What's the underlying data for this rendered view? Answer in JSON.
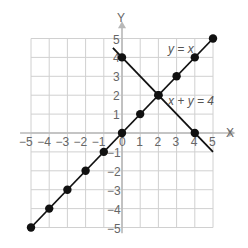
{
  "chart_data": {
    "type": "line",
    "title": "",
    "xlabel": "X",
    "ylabel": "Y",
    "xlim": [
      -5,
      5
    ],
    "ylim": [
      -5,
      5
    ],
    "grid": true,
    "x_ticks": [
      "-5",
      "-4",
      "-3",
      "-2",
      "-1",
      "0",
      "1",
      "2",
      "3",
      "4",
      "5"
    ],
    "y_ticks": [
      "-5",
      "-4",
      "-3",
      "-2",
      "-1",
      "1",
      "2",
      "3",
      "4",
      "5"
    ],
    "series": [
      {
        "name": "y = x",
        "label": "y = x",
        "line": [
          [
            -5,
            -5
          ],
          [
            5,
            5
          ]
        ],
        "points": [
          [
            -5,
            -5
          ],
          [
            -4,
            -4
          ],
          [
            -3,
            -3
          ],
          [
            -2,
            -2
          ],
          [
            -1,
            -1
          ],
          [
            0,
            0
          ],
          [
            1,
            1
          ],
          [
            2,
            2
          ],
          [
            3,
            3
          ],
          [
            4,
            4
          ],
          [
            5,
            5
          ]
        ]
      },
      {
        "name": "x + y = 4",
        "label": "x + y = 4",
        "line": [
          [
            -0.5,
            4.5
          ],
          [
            5,
            -1
          ]
        ],
        "points": [
          [
            0,
            4
          ],
          [
            2,
            2
          ],
          [
            4,
            0
          ]
        ]
      }
    ],
    "intersection": [
      2,
      2
    ]
  },
  "axes": {
    "x_label": "X",
    "y_label": "Y"
  },
  "labels": {
    "line1": "y = x",
    "line2": "x + y = 4"
  },
  "colors": {
    "grid": "#d0d0d0",
    "axis": "#b8b8b8",
    "line": "#111111",
    "text": "#666666"
  }
}
